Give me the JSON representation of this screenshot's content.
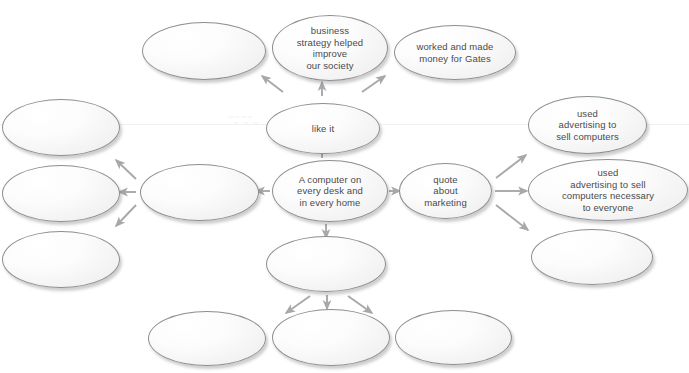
{
  "diagram": {
    "background_color": "#ffffff",
    "node_border_color": "#8e8e90",
    "node_fill_color": "#f5f5f5",
    "arrow_color": "#a8a8ac",
    "text_color": "#4a4a4c",
    "watermarks": [
      {
        "text": "~~~~",
        "x": 228,
        "y": 112
      },
      {
        "text": "~ ~ ~",
        "x": 233,
        "y": 118
      }
    ],
    "nodes": [
      {
        "id": "top-left-blank",
        "label": "",
        "empty": true,
        "x": 142,
        "y": 22,
        "w": 124,
        "h": 58
      },
      {
        "id": "business-strategy",
        "label": "business\nstrategy helped\nimprove\nour society",
        "empty": false,
        "x": 272,
        "y": 15,
        "w": 116,
        "h": 66
      },
      {
        "id": "worked-made-money",
        "label": "worked and made\nmoney for Gates",
        "empty": false,
        "x": 394,
        "y": 25,
        "w": 122,
        "h": 55
      },
      {
        "id": "left-upper-blank",
        "label": "",
        "empty": true,
        "x": 2,
        "y": 99,
        "w": 118,
        "h": 57
      },
      {
        "id": "like-it",
        "label": "like it",
        "empty": false,
        "x": 266,
        "y": 103,
        "w": 114,
        "h": 51
      },
      {
        "id": "used-advertising-sell",
        "label": "used\nadvertising to\nsell computers",
        "empty": false,
        "x": 528,
        "y": 96,
        "w": 119,
        "h": 58
      },
      {
        "id": "left-mid-blank",
        "label": "",
        "empty": true,
        "x": 2,
        "y": 165,
        "w": 118,
        "h": 57
      },
      {
        "id": "left-center-blank",
        "label": "",
        "empty": true,
        "x": 140,
        "y": 164,
        "w": 119,
        "h": 57
      },
      {
        "id": "computer-every-desk",
        "label": "A computer on\nevery desk and\nin every home",
        "empty": false,
        "x": 272,
        "y": 160,
        "w": 116,
        "h": 62
      },
      {
        "id": "quote-about-marketing",
        "label": "quote\nabout\nmarketing",
        "empty": false,
        "x": 399,
        "y": 163,
        "w": 93,
        "h": 56
      },
      {
        "id": "used-advertising-necessary",
        "label": "used\nadvertising to sell\ncomputers necessary\nto everyone",
        "empty": false,
        "x": 528,
        "y": 159,
        "w": 160,
        "h": 62
      },
      {
        "id": "left-lower-blank",
        "label": "",
        "empty": true,
        "x": 2,
        "y": 231,
        "w": 118,
        "h": 57
      },
      {
        "id": "center-lower-blank",
        "label": "",
        "empty": true,
        "x": 266,
        "y": 236,
        "w": 120,
        "h": 56
      },
      {
        "id": "right-lower-blank",
        "label": "",
        "empty": true,
        "x": 531,
        "y": 229,
        "w": 122,
        "h": 56
      },
      {
        "id": "bottom-left-blank",
        "label": "",
        "empty": true,
        "x": 148,
        "y": 311,
        "w": 118,
        "h": 55
      },
      {
        "id": "bottom-center-blank",
        "label": "",
        "empty": true,
        "x": 272,
        "y": 309,
        "w": 118,
        "h": 57
      },
      {
        "id": "bottom-right-blank",
        "label": "",
        "empty": true,
        "x": 395,
        "y": 310,
        "w": 117,
        "h": 55
      }
    ],
    "arrows": [
      {
        "id": "like-it-to-top-left",
        "x1": 283,
        "y1": 92,
        "x2": 262,
        "y2": 76
      },
      {
        "id": "like-it-to-business",
        "x1": 322,
        "y1": 96,
        "x2": 322,
        "y2": 82
      },
      {
        "id": "like-it-to-worked",
        "x1": 362,
        "y1": 92,
        "x2": 385,
        "y2": 76
      },
      {
        "id": "desk-to-like-it",
        "x1": 322,
        "y1": 158,
        "x2": 322,
        "y2": 144
      },
      {
        "id": "desk-to-left-center",
        "x1": 270,
        "y1": 191,
        "x2": 256,
        "y2": 191
      },
      {
        "id": "desk-to-quote",
        "x1": 389,
        "y1": 191,
        "x2": 400,
        "y2": 191
      },
      {
        "id": "left-center-to-upper",
        "x1": 136,
        "y1": 179,
        "x2": 116,
        "y2": 160
      },
      {
        "id": "left-center-to-mid",
        "x1": 136,
        "y1": 192,
        "x2": 119,
        "y2": 192
      },
      {
        "id": "left-center-to-lower",
        "x1": 136,
        "y1": 205,
        "x2": 116,
        "y2": 226
      },
      {
        "id": "quote-to-ads-sell",
        "x1": 496,
        "y1": 178,
        "x2": 526,
        "y2": 155
      },
      {
        "id": "quote-to-ads-nec",
        "x1": 495,
        "y1": 191,
        "x2": 527,
        "y2": 191
      },
      {
        "id": "quote-to-right-lower",
        "x1": 496,
        "y1": 205,
        "x2": 528,
        "y2": 230
      },
      {
        "id": "desk-to-center-lower",
        "x1": 326,
        "y1": 224,
        "x2": 326,
        "y2": 238
      },
      {
        "id": "center-lower-to-bl",
        "x1": 310,
        "y1": 296,
        "x2": 286,
        "y2": 313
      },
      {
        "id": "center-lower-to-bc",
        "x1": 327,
        "y1": 295,
        "x2": 327,
        "y2": 309
      },
      {
        "id": "center-lower-to-br",
        "x1": 348,
        "y1": 296,
        "x2": 372,
        "y2": 313
      }
    ]
  }
}
